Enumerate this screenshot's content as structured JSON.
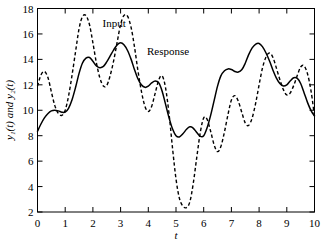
{
  "chart_data": {
    "type": "line",
    "title": "",
    "xlabel": "t",
    "ylabel": "y₁(t) and y₂(t)",
    "xlim": [
      0,
      10
    ],
    "ylim": [
      2,
      18
    ],
    "xticks": [
      0,
      1,
      2,
      3,
      4,
      5,
      6,
      7,
      8,
      9,
      10
    ],
    "yticks": [
      2,
      4,
      6,
      8,
      10,
      12,
      14,
      16,
      18
    ],
    "xtick_labels": [
      "0",
      "1",
      "2",
      "3",
      "4",
      "5",
      "6",
      "7",
      "8",
      "9",
      "10"
    ],
    "ytick_labels": [
      "2",
      "4",
      "6",
      "8",
      "10",
      "12",
      "14",
      "16",
      "18"
    ],
    "grid": false,
    "legend_position": "inline-annotation",
    "annotations": [
      {
        "text": "Input",
        "x": 2.35,
        "y": 16.55
      },
      {
        "text": "Response",
        "x": 3.95,
        "y": 14.35
      }
    ],
    "series": [
      {
        "name": "Input",
        "style": "dashed",
        "color": "#000000",
        "x": [
          0.0,
          0.12,
          0.25,
          0.38,
          0.5,
          0.62,
          0.75,
          0.88,
          1.0,
          1.12,
          1.25,
          1.38,
          1.5,
          1.62,
          1.75,
          1.88,
          2.0,
          2.12,
          2.25,
          2.38,
          2.5,
          2.62,
          2.75,
          2.88,
          3.0,
          3.12,
          3.25,
          3.38,
          3.5,
          3.62,
          3.75,
          3.88,
          4.0,
          4.12,
          4.25,
          4.38,
          4.5,
          4.62,
          4.75,
          4.88,
          5.0,
          5.12,
          5.25,
          5.38,
          5.5,
          5.62,
          5.75,
          5.88,
          6.0,
          6.12,
          6.25,
          6.38,
          6.5,
          6.62,
          6.75,
          6.88,
          7.0,
          7.12,
          7.25,
          7.38,
          7.5,
          7.62,
          7.75,
          7.88,
          8.0,
          8.12,
          8.25,
          8.38,
          8.5,
          8.62,
          8.75,
          8.88,
          9.0,
          9.12,
          9.25,
          9.38,
          9.5,
          9.62,
          9.75,
          9.88,
          10.0
        ],
        "y": [
          11.9,
          12.75,
          13.05,
          12.55,
          11.45,
          10.4,
          9.75,
          9.6,
          10.0,
          11.1,
          12.8,
          14.7,
          16.4,
          17.35,
          17.45,
          16.7,
          15.3,
          13.8,
          12.55,
          11.9,
          11.95,
          12.7,
          13.9,
          15.4,
          16.75,
          17.45,
          17.4,
          16.5,
          15.0,
          13.2,
          11.5,
          10.3,
          9.9,
          10.3,
          11.35,
          12.4,
          12.7,
          11.8,
          9.7,
          6.9,
          4.6,
          3.1,
          2.45,
          2.35,
          2.8,
          4.2,
          6.3,
          8.3,
          9.4,
          9.3,
          8.35,
          7.25,
          6.75,
          7.15,
          8.3,
          9.7,
          10.8,
          11.15,
          10.7,
          9.8,
          9.0,
          8.8,
          9.4,
          10.6,
          12.0,
          13.3,
          14.2,
          14.5,
          14.15,
          13.35,
          12.4,
          11.6,
          11.2,
          11.35,
          11.95,
          12.75,
          13.4,
          13.5,
          12.85,
          11.45,
          9.5
        ]
      },
      {
        "name": "Response",
        "style": "solid",
        "color": "#000000",
        "x": [
          0.0,
          0.12,
          0.25,
          0.38,
          0.5,
          0.62,
          0.75,
          0.88,
          1.0,
          1.12,
          1.25,
          1.38,
          1.5,
          1.62,
          1.75,
          1.88,
          2.0,
          2.12,
          2.25,
          2.38,
          2.5,
          2.62,
          2.75,
          2.88,
          3.0,
          3.12,
          3.25,
          3.38,
          3.5,
          3.62,
          3.75,
          3.88,
          4.0,
          4.12,
          4.25,
          4.38,
          4.5,
          4.62,
          4.75,
          4.88,
          5.0,
          5.12,
          5.25,
          5.38,
          5.5,
          5.62,
          5.75,
          5.88,
          6.0,
          6.12,
          6.25,
          6.38,
          6.5,
          6.62,
          6.75,
          6.88,
          7.0,
          7.12,
          7.25,
          7.38,
          7.5,
          7.62,
          7.75,
          7.88,
          8.0,
          8.12,
          8.25,
          8.38,
          8.5,
          8.62,
          8.75,
          8.88,
          9.0,
          9.12,
          9.25,
          9.38,
          9.5,
          9.62,
          9.75,
          9.88,
          10.0
        ],
        "y": [
          8.35,
          8.9,
          9.4,
          9.75,
          9.95,
          10.0,
          9.95,
          9.85,
          9.85,
          10.15,
          10.85,
          11.85,
          12.9,
          13.7,
          14.1,
          14.15,
          13.85,
          13.5,
          13.35,
          13.45,
          13.8,
          14.25,
          14.75,
          15.15,
          15.3,
          15.15,
          14.7,
          14.0,
          13.2,
          12.5,
          12.0,
          11.8,
          11.9,
          12.15,
          12.3,
          12.15,
          11.5,
          10.5,
          9.4,
          8.5,
          8.0,
          7.9,
          8.15,
          8.5,
          8.7,
          8.6,
          8.25,
          7.95,
          8.0,
          8.6,
          9.6,
          10.8,
          11.9,
          12.7,
          13.1,
          13.25,
          13.2,
          13.05,
          13.0,
          13.2,
          13.7,
          14.35,
          14.9,
          15.2,
          15.25,
          15.0,
          14.5,
          13.85,
          13.15,
          12.55,
          12.1,
          11.9,
          12.0,
          12.3,
          12.55,
          12.5,
          12.1,
          11.4,
          10.6,
          9.95,
          9.55
        ]
      }
    ]
  }
}
